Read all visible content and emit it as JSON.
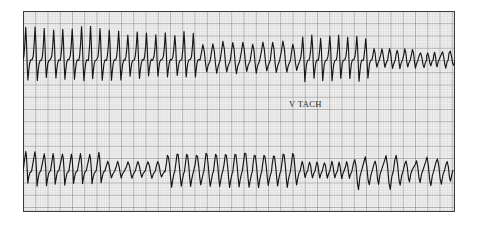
{
  "figure": {
    "kind": "ecg-rhythm-strip",
    "background_color": "#ffffff",
    "paper": {
      "x": 23,
      "y": 11,
      "width": 432,
      "height": 201,
      "paper_color": "#f2f2f2",
      "fine_grid_color": "#b9b9b9",
      "bold_grid_color": "#6f6f6f",
      "border_color": "#3b3b3b",
      "fine_grid_step_px": 2.45,
      "bold_grid_every": 5
    },
    "trace_color": "#1a1a1a",
    "trace_width_px": 1.15
  },
  "annotations": [
    {
      "name": "v-tach-label",
      "text": "V TACH",
      "x": 289,
      "y": 99,
      "font_size": 8.5,
      "color": "#2b2b2b"
    }
  ],
  "chart_data": {
    "type": "line",
    "title": "",
    "subtitle": "",
    "xlabel": "",
    "ylabel": "",
    "grid": true,
    "legend_position": "none",
    "xlim": [
      23,
      455
    ],
    "ylim_pixels_top": [
      11,
      112
    ],
    "ylim_pixels_bottom": [
      112,
      212
    ],
    "axis_visible": false,
    "tick_labels": [],
    "annotations": [
      "V TACH"
    ],
    "series": [
      {
        "name": "lead-strip-top",
        "baseline_y": 59,
        "comment": "wide-complex tachycardia, tall sharp peaks left, lower amplitude mid, degenerating irregular right",
        "segments": [
          {
            "from_x": 23,
            "to_x": 125,
            "cycle_px": 9.2,
            "peak_amp": 30,
            "trough_amp": 21,
            "shape": "spiked"
          },
          {
            "from_x": 125,
            "to_x": 200,
            "cycle_px": 9.2,
            "peak_amp": 26,
            "trough_amp": 19,
            "shape": "spiked"
          },
          {
            "from_x": 200,
            "to_x": 300,
            "cycle_px": 9.6,
            "peak_amp": 18,
            "trough_amp": 15,
            "shape": "rounded"
          },
          {
            "from_x": 300,
            "to_x": 372,
            "cycle_px": 9.6,
            "peak_amp": 22,
            "trough_amp": 22,
            "shape": "spiked"
          },
          {
            "from_x": 372,
            "to_x": 418,
            "cycle_px": 8.2,
            "peak_amp": 11,
            "trough_amp": 10,
            "shape": "rounded"
          },
          {
            "from_x": 418,
            "to_x": 455,
            "cycle_px": 7.0,
            "peak_amp": 8,
            "trough_amp": 9,
            "shape": "irregular"
          }
        ]
      },
      {
        "name": "lead-strip-bottom",
        "baseline_y": 170,
        "comment": "sawtooth monomorphic VT left, sinusoidal mid, coarse irregular right",
        "segments": [
          {
            "from_x": 23,
            "to_x": 105,
            "cycle_px": 9.4,
            "peak_amp": 18,
            "trough_amp": 16,
            "shape": "sawtooth"
          },
          {
            "from_x": 105,
            "to_x": 165,
            "cycle_px": 9.4,
            "peak_amp": 10,
            "trough_amp": 9,
            "shape": "rounded"
          },
          {
            "from_x": 165,
            "to_x": 300,
            "cycle_px": 9.8,
            "peak_amp": 17,
            "trough_amp": 17,
            "shape": "sinusoid"
          },
          {
            "from_x": 300,
            "to_x": 352,
            "cycle_px": 8.0,
            "peak_amp": 9,
            "trough_amp": 9,
            "shape": "rounded"
          },
          {
            "from_x": 352,
            "to_x": 455,
            "cycle_px": 10.5,
            "peak_amp": 14,
            "trough_amp": 18,
            "shape": "irregular"
          }
        ]
      }
    ]
  }
}
